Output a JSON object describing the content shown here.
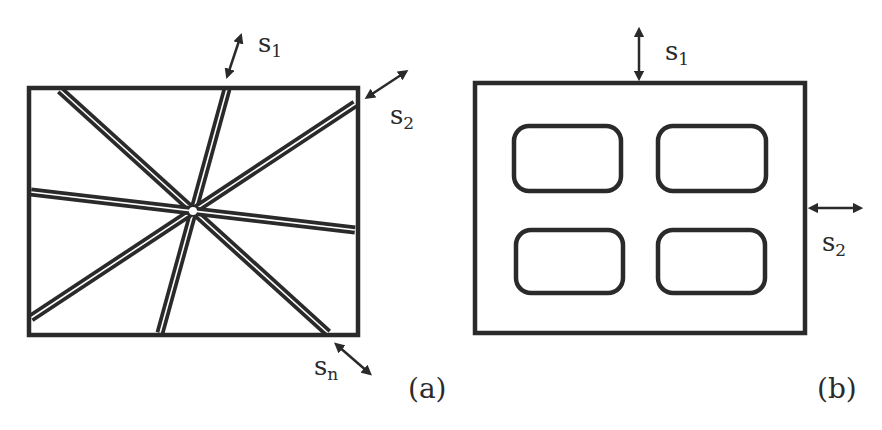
{
  "figure": {
    "panels": [
      {
        "id": "a",
        "caption": "(a)",
        "description": "Rectangular region crossed by several straight double-line channels intersecting at a single central point",
        "labels": [
          {
            "base": "s",
            "sub": "1"
          },
          {
            "base": "s",
            "sub": "2"
          },
          {
            "base": "s",
            "sub": "n"
          }
        ],
        "channel_count": 4
      },
      {
        "id": "b",
        "caption": "(b)",
        "description": "Rectangular region containing a 2x2 grid of rounded-rectangle holes",
        "labels": [
          {
            "base": "s",
            "sub": "1"
          },
          {
            "base": "s",
            "sub": "2"
          }
        ],
        "hole_count": 4
      }
    ],
    "stroke_color": "#2a2a2a",
    "background": "#ffffff"
  }
}
